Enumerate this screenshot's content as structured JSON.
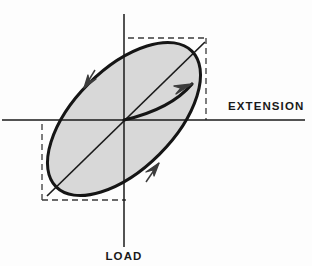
{
  "figure": {
    "background_color": "#fdfdfd",
    "ink_color": "#1a1a1a",
    "fill_color": "#d8d8d8",
    "dashed_color": "#3a3a3a"
  },
  "axes": {
    "horizontal": {
      "label": "EXTENSION",
      "label_position": "right-of-axis",
      "y": 120,
      "x_start": 2,
      "x_end": 305
    },
    "vertical": {
      "label": "LOAD",
      "label_position": "below-axis",
      "x": 124,
      "y_start": 14,
      "y_end": 247
    },
    "origin": {
      "x": 124,
      "y": 120
    }
  },
  "bounding_box": {
    "kind": "dashed-rectangle",
    "left": 42,
    "right": 206,
    "top": 38,
    "bottom": 200,
    "dash_pattern": "6 4"
  },
  "loop": {
    "kind": "ellipse",
    "center_x": 124,
    "center_y": 119,
    "semi_major": 96,
    "semi_minor": 50,
    "rotation_deg": -45,
    "filled": true,
    "stroke_width": 3
  },
  "median_line": {
    "kind": "straight-diagonal",
    "x1": 47,
    "y1": 196,
    "x2": 205,
    "y2": 42,
    "stroke_width": 1.6
  },
  "loading_arrow": {
    "kind": "curved-arrow-from-origin",
    "x1": 124,
    "y1": 120,
    "x2": 190,
    "y2": 84,
    "stroke_width": 3.2
  },
  "direction_arrows": [
    {
      "name": "upper-left-arrowhead",
      "x": 88,
      "y": 82,
      "angle_deg": 228,
      "sense": "counterclockwise"
    },
    {
      "name": "lower-right-arrowhead",
      "x": 154,
      "y": 168,
      "angle_deg": 48,
      "sense": "counterclockwise"
    }
  ],
  "labels": {
    "extension": "EXTENSION",
    "load": "LOAD"
  }
}
